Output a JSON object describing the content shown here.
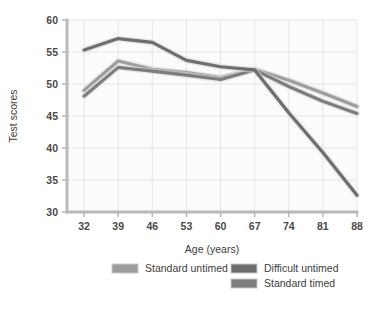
{
  "chart_data": {
    "type": "line",
    "title": "",
    "xlabel": "Age (years)",
    "ylabel": "Test scores",
    "x": [
      32,
      39,
      46,
      53,
      60,
      67,
      74,
      81,
      88
    ],
    "xticks": [
      "32",
      "39",
      "46",
      "53",
      "60",
      "67",
      "74",
      "81",
      "88"
    ],
    "yticks": [
      "30",
      "35",
      "40",
      "45",
      "50",
      "55",
      "60"
    ],
    "xlim": [
      28.5,
      88
    ],
    "ylim": [
      30,
      60
    ],
    "grid": true,
    "legend_position": "bottom",
    "series": [
      {
        "name": "Standard untimed",
        "color": "#9d9d9d",
        "values": [
          49.0,
          53.6,
          52.3,
          51.8,
          51.0,
          52.3,
          50.6,
          48.6,
          46.5
        ]
      },
      {
        "name": "Difficult untimed",
        "color": "#6e6e6e",
        "values": [
          55.3,
          57.1,
          56.5,
          53.7,
          52.7,
          52.2,
          45.5,
          39.3,
          32.6
        ]
      },
      {
        "name": "Standard timed",
        "color": "#7d7d7d",
        "values": [
          48.1,
          52.6,
          52.0,
          51.4,
          50.7,
          52.2,
          49.6,
          47.3,
          45.4
        ]
      }
    ]
  },
  "axes": {
    "y_axis_label": "Test scores",
    "x_axis_label": "Age (years)"
  },
  "legend": {
    "entries": [
      {
        "label": "Standard untimed",
        "color": "#9d9d9d"
      },
      {
        "label": "Difficult untimed",
        "color": "#6e6e6e"
      },
      {
        "label": "Standard timed",
        "color": "#7d7d7d"
      }
    ]
  },
  "colors": {
    "plot_background": "#fbfbfb",
    "grid": "#e6e6e6",
    "axis": "#b9b9b9",
    "text": "#3d3d3d"
  }
}
